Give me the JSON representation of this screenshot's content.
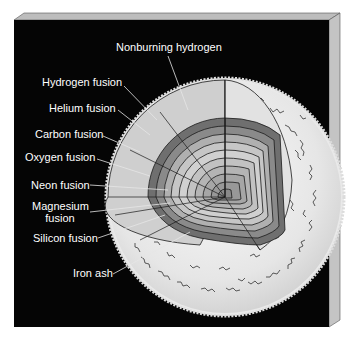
{
  "diagram": {
    "colors": {
      "background": "#050505",
      "panel_edge": "#b8b8b8",
      "panel_edge_dark": "#8a8a8a",
      "outer_envelope": "#e8e8e8",
      "shell_light": "#d2d2d2",
      "shell_mid": "#a9a9a9",
      "shell_dark": "#6f6f6f",
      "line": "#1a1a1a",
      "label_text": "#ffffff"
    },
    "labels": [
      {
        "id": "nonburning-hydrogen",
        "text": "Nonburning hydrogen"
      },
      {
        "id": "hydrogen-fusion",
        "text": "Hydrogen fusion"
      },
      {
        "id": "helium-fusion",
        "text": "Helium fusion"
      },
      {
        "id": "carbon-fusion",
        "text": "Carbon fusion"
      },
      {
        "id": "oxygen-fusion",
        "text": "Oxygen fusion"
      },
      {
        "id": "neon-fusion",
        "text": "Neon fusion"
      },
      {
        "id": "magnesium-fusion",
        "text": "Magnesium\nfusion",
        "line1": "Magnesium",
        "line2": "fusion"
      },
      {
        "id": "silicon-fusion",
        "text": "Silicon fusion"
      },
      {
        "id": "iron-ash",
        "text": "Iron ash"
      }
    ]
  }
}
